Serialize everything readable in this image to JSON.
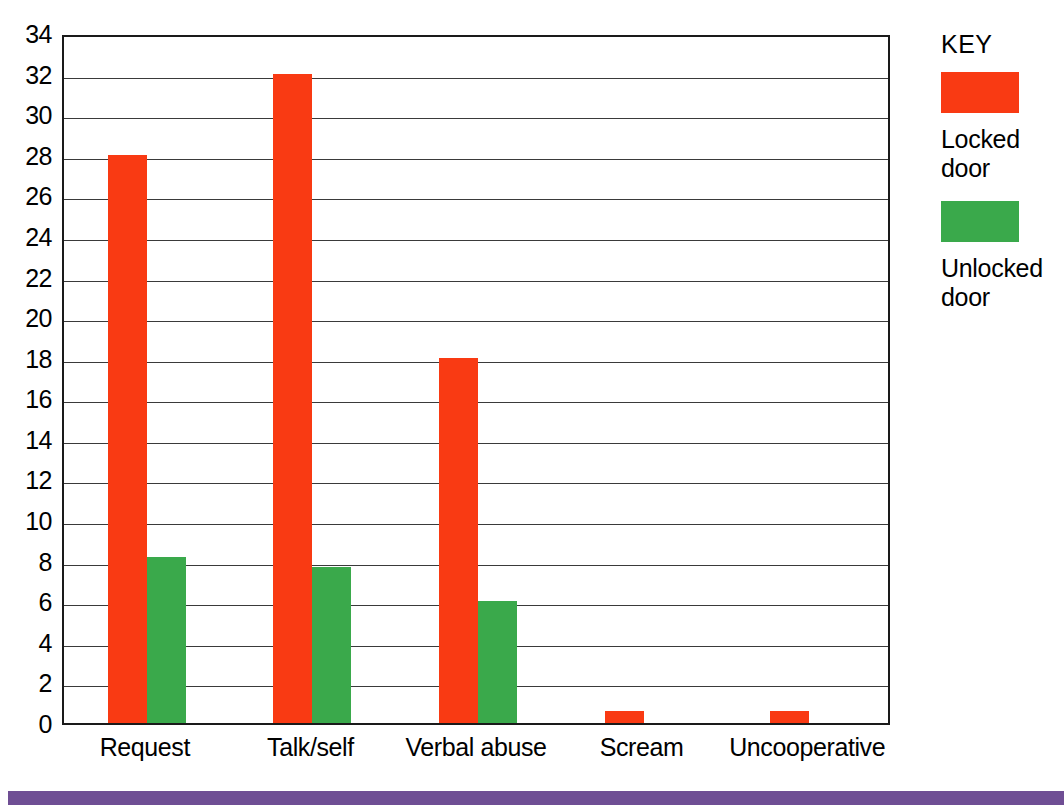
{
  "chart_data": {
    "type": "bar",
    "title": "",
    "xlabel": "",
    "ylabel": "",
    "ylim": [
      0,
      34
    ],
    "ytick_step": 2,
    "yticks": [
      34,
      32,
      30,
      28,
      26,
      24,
      22,
      20,
      18,
      16,
      14,
      12,
      10,
      8,
      6,
      4,
      2,
      0
    ],
    "categories": [
      "Request",
      "Talk/self",
      "Verbal abuse",
      "Scream",
      "Uncooperative"
    ],
    "grid": true,
    "legend_position": "right",
    "series": [
      {
        "name": "Locked door",
        "color": "#f93a13",
        "values": [
          28,
          32,
          18,
          0.6,
          0.6
        ]
      },
      {
        "name": "Unlocked door",
        "color": "#3aa94b",
        "values": [
          8.2,
          7.7,
          6,
          0,
          0
        ]
      }
    ]
  },
  "legend": {
    "title": "KEY",
    "items": [
      {
        "label_line1": "Locked",
        "label_line2": "door",
        "color": "#f93a13",
        "swatch_name": "locked-door-swatch"
      },
      {
        "label_line1": "Unlocked",
        "label_line2": "door",
        "color": "#3aa94b",
        "swatch_name": "unlocked-door-swatch"
      }
    ]
  },
  "decor": {
    "band_color": "#6f4e94"
  }
}
